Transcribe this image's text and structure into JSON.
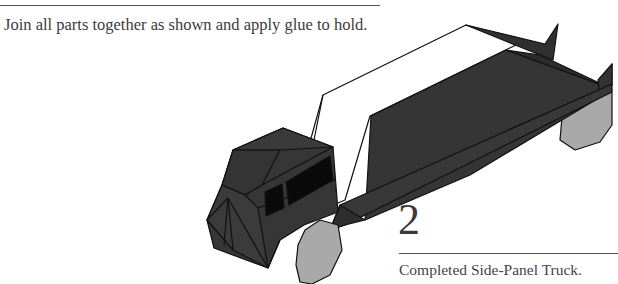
{
  "page": {
    "instruction": "Join all parts together as shown and apply glue to hold.",
    "step_number": "2",
    "caption": "Completed Side-Panel Truck."
  },
  "illustration": {
    "subject": "side-panel-truck",
    "colors": {
      "body": "#333333",
      "body_light": "#3d3d3d",
      "window": "#0a0a0a",
      "wheel": "#a9a9a9",
      "outline": "#111111",
      "panel": "#ffffff"
    }
  }
}
